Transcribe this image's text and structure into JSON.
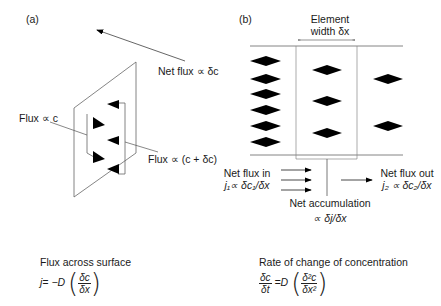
{
  "panel_a": {
    "label": "(a)",
    "net_flux": "Net flux ∝ δc",
    "flux_c": "Flux ∝ c",
    "flux_c_dc": "Flux ∝ (c + δc)"
  },
  "panel_b": {
    "label": "(b)",
    "element_width_line1": "Element",
    "element_width_line2": "width δx",
    "net_flux_in": "Net flux in",
    "net_flux_in_formula": "j₁∝ δc₁/δx",
    "net_flux_out": "Net flux out",
    "net_flux_out_formula": "j₂ ∝ δc₂/δx",
    "net_accumulation": "Net accumulation",
    "net_accumulation_formula": "∝ δj/δx"
  },
  "equations": {
    "flux_title": "Flux across surface",
    "flux_lhs": "j=",
    "flux_coeff": "−D",
    "flux_num": "δc",
    "flux_den": "δx",
    "rate_title": "Rate of change of concentration",
    "rate_lhs_num": "δc",
    "rate_lhs_den": "δt",
    "rate_coeff": "=D",
    "rate_num": "δ²c",
    "rate_den": "δx²"
  },
  "colors": {
    "line": "#555555",
    "arrow": "#000000",
    "text": "#1a1a1a"
  }
}
